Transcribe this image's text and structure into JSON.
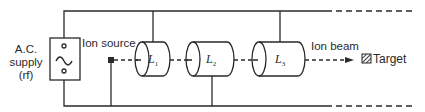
{
  "diagram": {
    "type": "linear accelerator schematic",
    "supply": {
      "line1": "A.C.",
      "line2": "supply",
      "line3": "(rf)",
      "symbol": "~"
    },
    "ion_source_label": "Ion source",
    "lenses": [
      {
        "label": "L",
        "sub": "1"
      },
      {
        "label": "L",
        "sub": "2"
      },
      {
        "label": "L",
        "sub": "3"
      }
    ],
    "ion_beam_label": "Ion beam",
    "target_label": "Target",
    "colors": {
      "line": "#2a2a2a",
      "background": "#ffffff"
    }
  }
}
